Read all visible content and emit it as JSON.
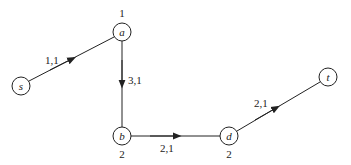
{
  "diagram": {
    "type": "directed-graph",
    "nodes": [
      {
        "id": "s",
        "label": "s",
        "value": ""
      },
      {
        "id": "a",
        "label": "a",
        "value": "1"
      },
      {
        "id": "b",
        "label": "b",
        "value": "2"
      },
      {
        "id": "d",
        "label": "d",
        "value": "2"
      },
      {
        "id": "t",
        "label": "t",
        "value": ""
      }
    ],
    "edges": [
      {
        "from": "s",
        "to": "a",
        "label": "1,1"
      },
      {
        "from": "a",
        "to": "b",
        "label": "3,1"
      },
      {
        "from": "b",
        "to": "d",
        "label": "2,1"
      },
      {
        "from": "d",
        "to": "t",
        "label": "2,1"
      }
    ]
  }
}
